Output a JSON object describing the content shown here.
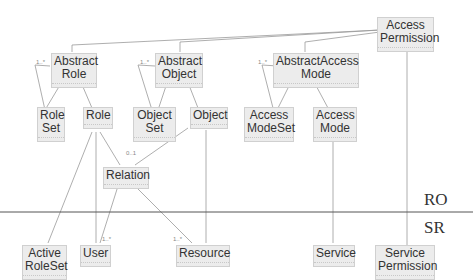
{
  "classes": {
    "access_permission": "Access\nPermission",
    "abstract_role": "Abstract\nRole",
    "abstract_object": "Abstract\nObject",
    "abstract_access_mode": "AbstractAccess\nMode",
    "role_set": "Role\nSet",
    "role": "Role",
    "object_set": "Object\nSet",
    "object": "Object",
    "access_mode_set": "Access\nModeSet",
    "access_mode": "Access\nMode",
    "relation": "Relation",
    "active_role_set": "Active\nRoleSet",
    "user": "User",
    "resource": "Resource",
    "service": "Service",
    "service_permission": "Service\nPermission"
  },
  "layers": {
    "upper": "RO",
    "lower": "SR"
  },
  "multiplicities": {
    "one_many": "1..*",
    "one": "1",
    "zero_one": "0..1"
  }
}
